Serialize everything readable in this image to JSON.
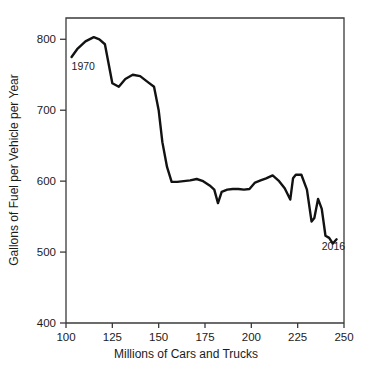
{
  "chart_data": {
    "type": "line",
    "title": "",
    "xlabel": "Millions of Cars and Trucks",
    "ylabel": "Gallons of Fuel per Vehicle per Year",
    "xlim": [
      100,
      250
    ],
    "ylim": [
      400,
      830
    ],
    "grid": false,
    "legend": null,
    "xticks": [
      100,
      125,
      150,
      175,
      200,
      225,
      250
    ],
    "xtick_labels": [
      "100",
      "125",
      "150",
      "175",
      "200",
      "225",
      "250"
    ],
    "yticks": [
      400,
      500,
      600,
      700,
      800
    ],
    "ytick_labels": [
      "400",
      "500",
      "600",
      "700",
      "800"
    ],
    "annotations": [
      {
        "text": "1970",
        "x": 103,
        "y": 757
      },
      {
        "text": "2016",
        "x": 238,
        "y": 503
      }
    ],
    "series": [
      {
        "name": "Fuel per vehicle",
        "x": [
          103.0,
          106.0,
          110.5,
          115.0,
          118.0,
          121.0,
          125.0,
          128.5,
          132.0,
          136.0,
          140.0,
          144.0,
          147.5,
          150.0,
          152.0,
          154.5,
          157.0,
          160.0,
          163.5,
          167.0,
          170.5,
          174.0,
          177.5,
          180.0,
          182.0,
          184.0,
          187.0,
          190.0,
          193.0,
          196.0,
          199.0,
          202.0,
          205.0,
          208.0,
          211.5,
          215.0,
          218.0,
          221.0,
          222.5,
          224.0,
          227.0,
          230.0,
          232.5,
          234.0,
          236.0,
          238.0,
          240.0,
          242.0,
          244.0,
          246.0
        ],
        "values": [
          775.0,
          786.0,
          797.0,
          803.0,
          800.0,
          793.0,
          738.0,
          733.0,
          744.0,
          750.0,
          748.0,
          740.0,
          733.0,
          700.0,
          655.0,
          620.0,
          599.0,
          599.0,
          600.0,
          601.0,
          603.0,
          600.0,
          594.0,
          588.0,
          569.0,
          585.0,
          588.0,
          589.0,
          589.0,
          588.0,
          589.0,
          598.0,
          601.0,
          604.0,
          608.0,
          600.0,
          590.0,
          574.0,
          604.0,
          609.0,
          609.0,
          588.0,
          543.0,
          548.0,
          575.0,
          561.0,
          523.0,
          520.0,
          512.0,
          518.0
        ]
      }
    ]
  }
}
